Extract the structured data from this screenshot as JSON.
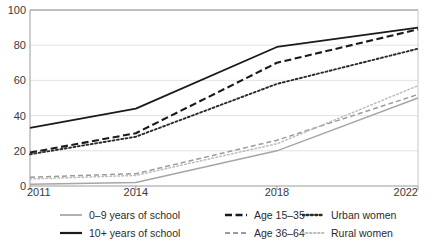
{
  "chart_data": {
    "type": "line",
    "title": "",
    "xlabel": "",
    "ylabel": "",
    "x": [
      2011,
      2014,
      2018,
      2022
    ],
    "tick_labels_x": [
      "2011",
      "2014",
      "2018",
      "2022"
    ],
    "tick_labels_y": [
      "0",
      "20",
      "40",
      "60",
      "80",
      "100"
    ],
    "ylim": [
      0,
      100
    ],
    "xlim": [
      2011,
      2022
    ],
    "grid": "horizontal",
    "legend_position": "bottom",
    "series": [
      {
        "name": "0–9 years of school",
        "values": [
          1,
          2,
          20,
          50
        ],
        "style": "solid",
        "color": "#a6a6a6",
        "width": 1.4
      },
      {
        "name": "10+ years of school",
        "values": [
          33,
          44,
          79,
          90
        ],
        "style": "solid",
        "color": "#1a1a1a",
        "width": 1.8
      },
      {
        "name": "Age 15–35",
        "values": [
          19,
          30,
          70,
          89
        ],
        "style": "dashed",
        "color": "#1a1a1a",
        "width": 2.1
      },
      {
        "name": "Age 36–64",
        "values": [
          5,
          7,
          26,
          52
        ],
        "style": "dashed",
        "color": "#9b9b9b",
        "width": 1.5
      },
      {
        "name": "Urban women",
        "values": [
          18,
          28,
          58,
          78
        ],
        "style": "dotted",
        "color": "#2b2b2b",
        "width": 1.9
      },
      {
        "name": "Rural women",
        "values": [
          4,
          6,
          24,
          57
        ],
        "style": "dotted",
        "color": "#bcbcbc",
        "width": 1.5
      }
    ]
  },
  "legend": {
    "columns": [
      {
        "items": [
          "0–9 years of school",
          "10+ years of school"
        ]
      },
      {
        "items": [
          "Age 15–35",
          "Age 36–64"
        ]
      },
      {
        "items": [
          "Urban women",
          "Rural women"
        ]
      }
    ]
  },
  "ghost_text": {
    "top_title_fragment": "",
    "marker": ""
  }
}
